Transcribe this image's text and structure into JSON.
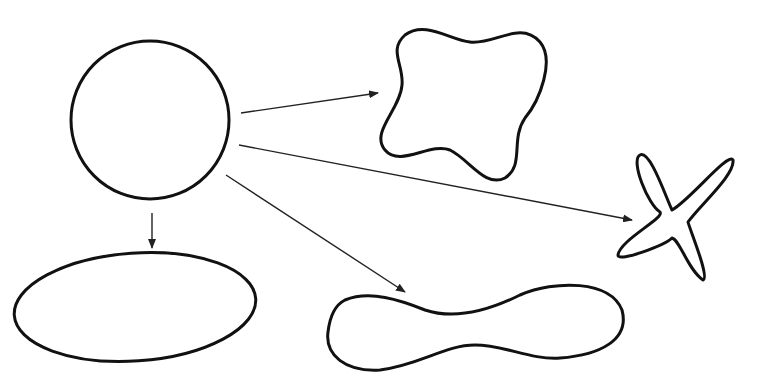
{
  "diagram": {
    "colors": {
      "stroke": "#111111",
      "arrow": "#222222",
      "background": "#ffffff"
    },
    "source_shape": {
      "type": "circle",
      "cx": 150,
      "cy": 120,
      "r": 79
    },
    "targets": [
      {
        "name": "four-lobed-square",
        "path": "M 405 35 C 425 20, 450 40, 470 42 C 495 45, 520 20, 540 42 C 555 60, 540 100, 525 118 C 510 140, 525 165, 505 178 C 485 188, 470 160, 450 150 C 430 142, 400 168, 385 150 C 370 132, 400 110, 402 85 C 404 65, 388 50, 405 35 Z"
      },
      {
        "name": "four-armed-star",
        "path": "M 640 155 C 630 160, 648 205, 660 212 C 665 218, 620 240, 618 255 C 618 263, 665 245, 672 238 C 680 240, 688 270, 703 280 C 710 278, 690 230, 688 222 C 700 205, 735 175, 733 160 C 728 152, 690 200, 672 210 C 665 195, 650 150, 640 155 Z"
      },
      {
        "name": "peanut-shape",
        "path": "M 345 300 C 370 290, 400 300, 425 310 C 455 320, 490 310, 520 295 C 555 280, 610 280, 622 310 C 630 340, 600 355, 560 358 C 530 360, 505 345, 475 345 C 445 345, 420 365, 380 370 C 345 372, 325 355, 328 332 C 330 315, 335 305, 345 300 Z"
      },
      {
        "name": "ellipse",
        "cx": 135,
        "cy": 307,
        "rx": 121,
        "ry": 54,
        "rotate": -4
      }
    ],
    "arrows": [
      {
        "name": "arrow-to-four-lobed-square",
        "x1": 241,
        "y1": 113,
        "x2": 378,
        "y2": 93
      },
      {
        "name": "arrow-to-four-armed-star",
        "x1": 239,
        "y1": 145,
        "x2": 632,
        "y2": 220
      },
      {
        "name": "arrow-to-peanut-shape",
        "x1": 226,
        "y1": 175,
        "x2": 405,
        "y2": 292
      },
      {
        "name": "arrow-to-ellipse",
        "x1": 152,
        "y1": 213,
        "x2": 152,
        "y2": 248
      }
    ]
  }
}
